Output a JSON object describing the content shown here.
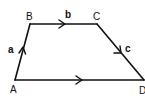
{
  "diagram": {
    "type": "vector-quadrilateral",
    "stroke_color": "#111111",
    "background": "#ffffff",
    "vertices": [
      {
        "id": "A",
        "label": "A",
        "x": 15,
        "y": 80
      },
      {
        "id": "B",
        "label": "B",
        "x": 30,
        "y": 24
      },
      {
        "id": "C",
        "label": "C",
        "x": 97,
        "y": 24
      },
      {
        "id": "D",
        "label": "D",
        "x": 144,
        "y": 80
      }
    ],
    "edges": [
      {
        "from": "A",
        "to": "B",
        "label": "a",
        "direction": "A→B"
      },
      {
        "from": "B",
        "to": "C",
        "label": "b",
        "direction": "B→C"
      },
      {
        "from": "C",
        "to": "D",
        "label": "c",
        "direction": "C→D"
      },
      {
        "from": "A",
        "to": "D",
        "label": "",
        "direction": "A→D"
      }
    ]
  }
}
